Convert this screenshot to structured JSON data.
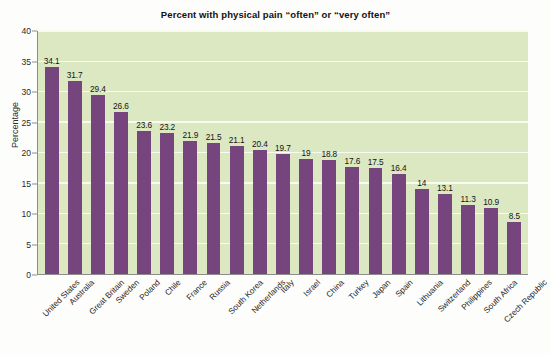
{
  "chart_data": {
    "type": "bar",
    "title": "Percent with physical pain “often” or “very often”",
    "xlabel": "",
    "ylabel": "Percentage",
    "ylim": [
      0,
      40
    ],
    "ytick_step": 5,
    "yticks": [
      "0",
      "5",
      "10",
      "15",
      "20",
      "25",
      "30",
      "35",
      "40"
    ],
    "grid": true,
    "legend": "none",
    "bar_color": "#77457e",
    "plot_background": "#dce8c2",
    "gridline_color": "#f7fbf0",
    "categories": [
      "United States",
      "Australia",
      "Great Britain",
      "Sweden",
      "Poland",
      "Chile",
      "France",
      "Russia",
      "South Korea",
      "Netherlands",
      "Italy",
      "Israel",
      "China",
      "Turkey",
      "Japan",
      "Spain",
      "Lithuania",
      "Switzerland",
      "Philippines",
      "South Africa",
      "Czech Republic"
    ],
    "values": [
      34.1,
      31.7,
      29.4,
      26.6,
      23.6,
      23.2,
      21.9,
      21.5,
      21.1,
      20.4,
      19.7,
      19,
      18.8,
      17.6,
      17.5,
      16.4,
      14,
      13.1,
      11.3,
      10.9,
      8.5
    ],
    "value_labels": [
      "34.1",
      "31.7",
      "29.4",
      "26.6",
      "23.6",
      "23.2",
      "21.9",
      "21.5",
      "21.1",
      "20.4",
      "19.7",
      "19",
      "18.8",
      "17.6",
      "17.5",
      "16.4",
      "14",
      "13.1",
      "11.3",
      "10.9",
      "8.5"
    ]
  }
}
